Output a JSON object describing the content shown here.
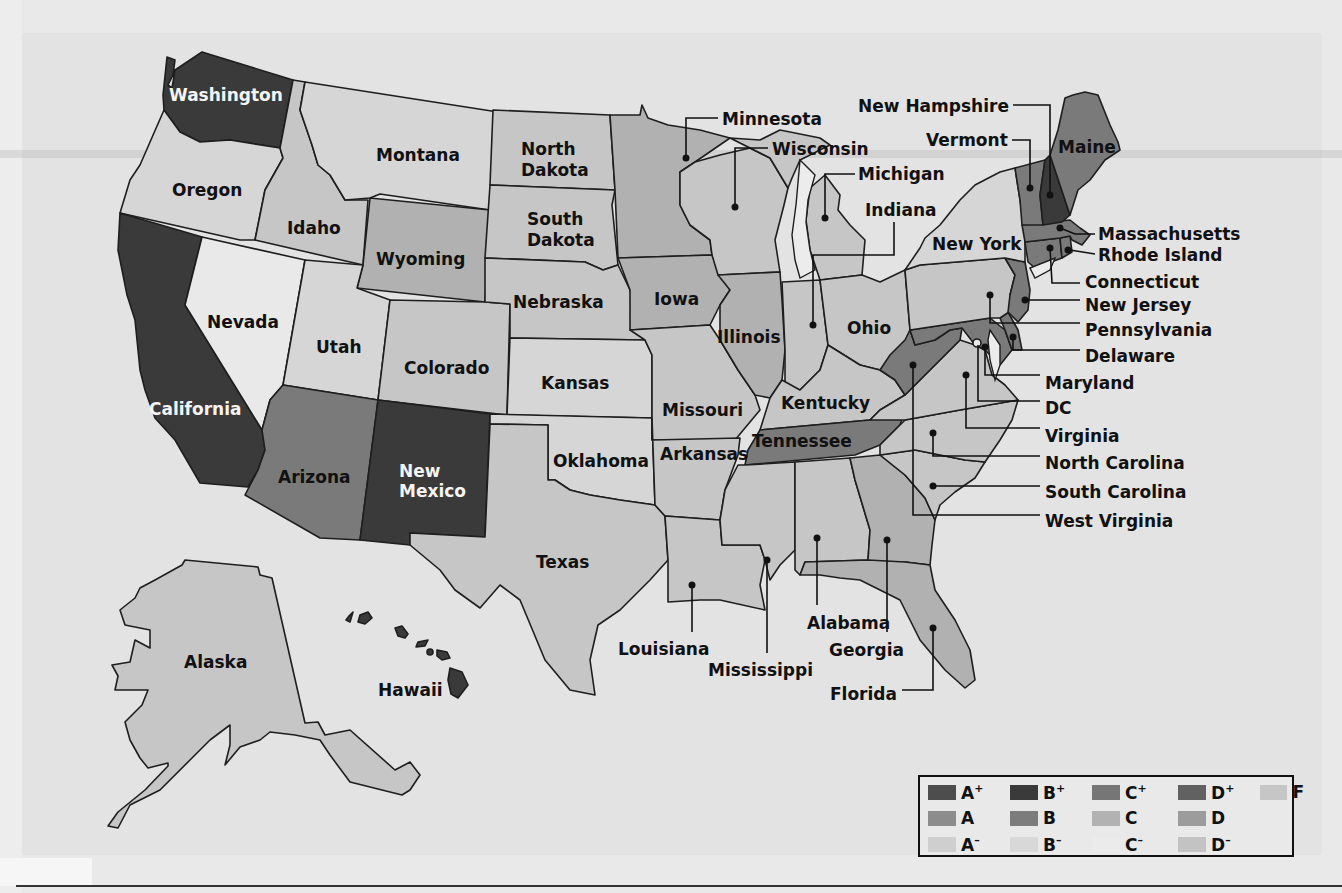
{
  "map": {
    "title_visible": false,
    "grade_colors": {
      "A+": "#4a4a4a",
      "A": "#8a8a8a",
      "A-": "#cdcdcd",
      "B+": "#3a3a3a",
      "B": "#7a7a7a",
      "B-": "#d6d6d6",
      "C+": "#747474",
      "C": "#b1b1b1",
      "C-": "#e9e9e9",
      "D+": "#606060",
      "D": "#9a9a9a",
      "D-": "#c2c2c2",
      "F": "#c6c6c6"
    },
    "states": {
      "washington": {
        "label": "Washington",
        "grade": "B+"
      },
      "oregon": {
        "label": "Oregon",
        "grade": "B-"
      },
      "california": {
        "label": "California",
        "grade": "B+"
      },
      "idaho": {
        "label": "Idaho",
        "grade": "F"
      },
      "nevada": {
        "label": "Nevada",
        "grade": "C-"
      },
      "montana": {
        "label": "Montana",
        "grade": "B-"
      },
      "wyoming": {
        "label": "Wyoming",
        "grade": "C"
      },
      "utah": {
        "label": "Utah",
        "grade": "B-"
      },
      "colorado": {
        "label": "Colorado",
        "grade": "F"
      },
      "arizona": {
        "label": "Arizona",
        "grade": "B"
      },
      "new_mexico": {
        "label": "New Mexico",
        "label_lines": [
          "New",
          "Mexico"
        ],
        "grade": "B+"
      },
      "north_dakota": {
        "label": "North Dakota",
        "label_lines": [
          "North",
          "Dakota"
        ],
        "grade": "F"
      },
      "south_dakota": {
        "label": "South Dakota",
        "label_lines": [
          "South",
          "Dakota"
        ],
        "grade": "F"
      },
      "nebraska": {
        "label": "Nebraska",
        "grade": "F"
      },
      "kansas": {
        "label": "Kansas",
        "grade": "B-"
      },
      "oklahoma": {
        "label": "Oklahoma",
        "grade": "B-"
      },
      "texas": {
        "label": "Texas",
        "grade": "F"
      },
      "minnesota": {
        "label": "Minnesota",
        "grade": "C"
      },
      "iowa": {
        "label": "Iowa",
        "grade": "C"
      },
      "missouri": {
        "label": "Missouri",
        "grade": "F"
      },
      "arkansas": {
        "label": "Arkansas",
        "grade": "F"
      },
      "louisiana": {
        "label": "Louisiana",
        "grade": "F"
      },
      "wisconsin": {
        "label": "Wisconsin",
        "grade": "F"
      },
      "illinois": {
        "label": "Illinois",
        "grade": "C"
      },
      "michigan": {
        "label": "Michigan",
        "grade": "F"
      },
      "indiana": {
        "label": "Indiana",
        "grade": "F"
      },
      "ohio": {
        "label": "Ohio",
        "grade": "F"
      },
      "kentucky": {
        "label": "Kentucky",
        "grade": "F"
      },
      "tennessee": {
        "label": "Tennessee",
        "grade": "B"
      },
      "mississippi": {
        "label": "Mississippi",
        "grade": "F"
      },
      "alabama": {
        "label": "Alabama",
        "grade": "F"
      },
      "georgia": {
        "label": "Georgia",
        "grade": "C"
      },
      "florida": {
        "label": "Florida",
        "grade": "C"
      },
      "south_carolina": {
        "label": "South Carolina",
        "grade": "F"
      },
      "north_carolina": {
        "label": "North Carolina",
        "grade": "F"
      },
      "virginia": {
        "label": "Virginia",
        "grade": "F"
      },
      "west_virginia": {
        "label": "West Virginia",
        "grade": "B"
      },
      "maryland": {
        "label": "Maryland",
        "grade": "B"
      },
      "dc": {
        "label": "DC",
        "grade": "C-"
      },
      "delaware": {
        "label": "Delaware",
        "grade": "B"
      },
      "pennsylvania": {
        "label": "Pennsylvania",
        "grade": "F"
      },
      "new_jersey": {
        "label": "New Jersey",
        "grade": "B"
      },
      "new_york": {
        "label": "New York",
        "grade": "B-"
      },
      "connecticut": {
        "label": "Connecticut",
        "grade": "B"
      },
      "rhode_island": {
        "label": "Rhode Island",
        "grade": "B"
      },
      "massachusetts": {
        "label": "Massachusetts",
        "grade": "B"
      },
      "vermont": {
        "label": "Vermont",
        "grade": "B"
      },
      "new_hampshire": {
        "label": "New Hampshire",
        "grade": "B+"
      },
      "maine": {
        "label": "Maine",
        "grade": "B"
      },
      "alaska": {
        "label": "Alaska",
        "grade": "F"
      },
      "hawaii": {
        "label": "Hawaii",
        "grade": "B+"
      }
    }
  },
  "legend": {
    "items": [
      {
        "grade": "A+",
        "letter": "A",
        "mod": "+",
        "color": "#4d4d4d"
      },
      {
        "grade": "B+",
        "letter": "B",
        "mod": "+",
        "color": "#3a3a3a"
      },
      {
        "grade": "C+",
        "letter": "C",
        "mod": "+",
        "color": "#767676"
      },
      {
        "grade": "D+",
        "letter": "D",
        "mod": "+",
        "color": "#616161"
      },
      {
        "grade": "F",
        "letter": "F",
        "mod": "",
        "color": "#c6c6c6"
      },
      {
        "grade": "A",
        "letter": "A",
        "mod": "",
        "color": "#8c8c8c"
      },
      {
        "grade": "B",
        "letter": "B",
        "mod": "",
        "color": "#7c7c7c"
      },
      {
        "grade": "C",
        "letter": "C",
        "mod": "",
        "color": "#b2b2b2"
      },
      {
        "grade": "D",
        "letter": "D",
        "mod": "",
        "color": "#9c9c9c"
      },
      {
        "grade": "",
        "letter": "",
        "mod": "",
        "color": ""
      },
      {
        "grade": "A-",
        "letter": "A",
        "mod": "–",
        "color": "#cfcfcf"
      },
      {
        "grade": "B-",
        "letter": "B",
        "mod": "–",
        "color": "#d8d8d8"
      },
      {
        "grade": "C-",
        "letter": "C",
        "mod": "–",
        "color": "#ebebeb"
      },
      {
        "grade": "D-",
        "letter": "D",
        "mod": "–",
        "color": "#c3c3c3"
      },
      {
        "grade": "",
        "letter": "",
        "mod": "",
        "color": ""
      }
    ]
  }
}
